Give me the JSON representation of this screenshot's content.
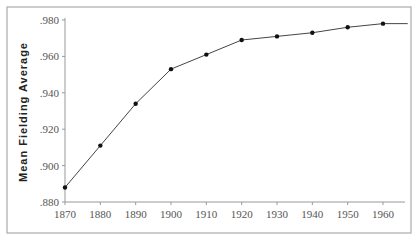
{
  "chart_data": {
    "type": "line",
    "title": "",
    "xlabel": "",
    "ylabel": "Mean Fielding Average",
    "x": [
      1870,
      1880,
      1890,
      1900,
      1910,
      1920,
      1930,
      1940,
      1950,
      1960
    ],
    "series": [
      {
        "name": "Mean Fielding Average",
        "values": [
          0.888,
          0.911,
          0.934,
          0.953,
          0.961,
          0.969,
          0.971,
          0.973,
          0.976,
          0.978
        ]
      }
    ],
    "line_end": {
      "x": 1967,
      "y": 0.978
    },
    "xlim": [
      1870,
      1968
    ],
    "ylim": [
      0.88,
      0.98
    ],
    "x_ticks": [
      "1870",
      "1880",
      "1890",
      "1900",
      "1910",
      "1920",
      "1930",
      "1940",
      "1950",
      "1960"
    ],
    "y_ticks": [
      ".880",
      ".900",
      ".920",
      ".940",
      ".960",
      ".980"
    ],
    "grid": false,
    "legend": "none",
    "colors": {
      "line": "#444444",
      "marker": "#111111",
      "frame": "#aaaaaa"
    }
  }
}
